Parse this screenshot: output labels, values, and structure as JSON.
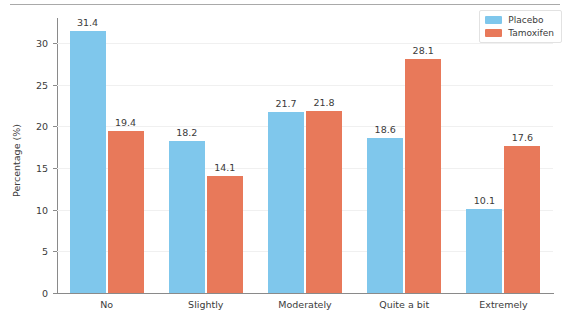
{
  "chart_data": {
    "type": "bar",
    "title": "",
    "subtitle": "",
    "xlabel": "",
    "ylabel": "Percentage (%)",
    "categories": [
      "No",
      "Slightly",
      "Moderately",
      "Quite a bit",
      "Extremely"
    ],
    "series": [
      {
        "name": "Placebo",
        "color": "#7fc7ec",
        "values": [
          31.4,
          18.2,
          21.7,
          18.6,
          10.1
        ]
      },
      {
        "name": "Tamoxifen",
        "color": "#e8795a",
        "values": [
          19.4,
          14.1,
          21.8,
          28.1,
          17.6
        ]
      }
    ],
    "ylim": [
      0,
      33
    ],
    "yticks": [
      0,
      5,
      10,
      15,
      20,
      25,
      30
    ],
    "ytick_labels": [
      "0",
      "5",
      "10",
      "15",
      "20",
      "25",
      "30"
    ],
    "grid": true,
    "grid_axis": "y",
    "legend_position": "top-right",
    "data_labels": true,
    "data_label_values": [
      [
        "31.4",
        "19.4"
      ],
      [
        "18.2",
        "14.1"
      ],
      [
        "21.7",
        "21.8"
      ],
      [
        "18.6",
        "28.1"
      ],
      [
        "10.1",
        "17.6"
      ]
    ]
  },
  "legend": {
    "items": [
      {
        "label": "Placebo",
        "swatch": "placebo"
      },
      {
        "label": "Tamoxifen",
        "swatch": "tamoxifen"
      }
    ]
  }
}
